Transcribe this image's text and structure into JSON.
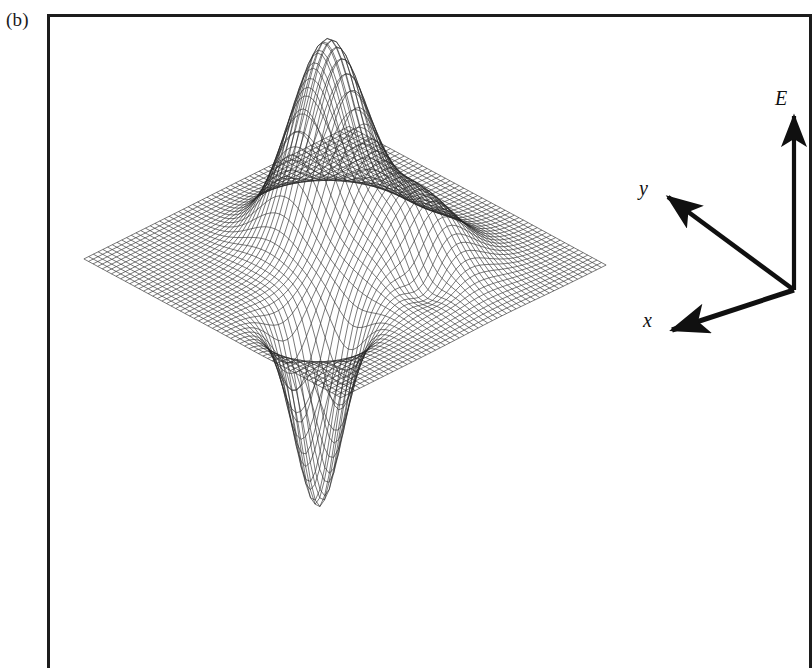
{
  "figure": {
    "panel_label": "(b)",
    "caption_visible": false
  },
  "axes": {
    "vertical": {
      "label": "E",
      "icon": "arrow-up-icon",
      "direction": "up"
    },
    "depth": {
      "label": "y",
      "icon": "arrow-upleft-icon",
      "direction": "up-left"
    },
    "horizontal": {
      "label": "x",
      "icon": "arrow-downleft-icon",
      "direction": "down-left"
    },
    "origin_x": 794,
    "origin_y": 290
  },
  "style": {
    "ink": "#1c1c1c",
    "mesh_stroke": "#262626",
    "background": "#ffffff",
    "frame_stroke": "#1c1c1c"
  },
  "chart_data": {
    "type": "surface",
    "title": "",
    "xlabel": "x",
    "ylabel": "y",
    "zlabel": "E",
    "grid": false,
    "legend": null,
    "projection": "oblique-wireframe",
    "render": "mesh-lines-only",
    "grid_n": 56,
    "domain": {
      "x": [
        -3,
        3
      ],
      "y": [
        -3,
        3
      ]
    },
    "zlim": [
      -1.05,
      1.0
    ],
    "features": [
      {
        "name": "main-positive-peak",
        "cx": -0.72,
        "cy": 0.3,
        "amplitude": 1.0,
        "sigma_x": 0.62,
        "sigma_y": 0.62
      },
      {
        "name": "secondary-positive-hump",
        "cx": 0.95,
        "cy": 0.62,
        "amplitude": 0.4,
        "sigma_x": 0.72,
        "sigma_y": 0.72
      },
      {
        "name": "shallow-depression",
        "cx": 1.58,
        "cy": 0.18,
        "amplitude": -0.17,
        "sigma_x": 0.36,
        "sigma_y": 0.33
      },
      {
        "name": "deep-negative-well",
        "cx": 1.05,
        "cy": -1.62,
        "amplitude": -0.95,
        "sigma_x": 0.4,
        "sigma_y": 0.4
      }
    ],
    "projection_params": {
      "x_axis_screen": [
        2.52,
        1.36
      ],
      "y_axis_screen": [
        2.6,
        -1.3
      ],
      "z_axis_screen": [
        0,
        -1
      ],
      "z_scale": 195,
      "center_x": 345,
      "center_y": 262
    }
  }
}
